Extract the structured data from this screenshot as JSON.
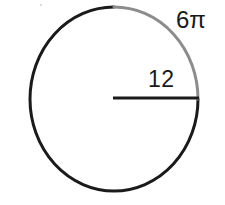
{
  "figure": {
    "type": "circle-geometry-diagram",
    "background_color": "#ffffff",
    "circle": {
      "center_x": 114,
      "center_y": 99,
      "radius_x": 84,
      "radius_y": 92,
      "stroke_color_main": "#1a1a1a",
      "stroke_color_arc": "#8c8c8c",
      "stroke_width": 3
    },
    "arc": {
      "label": "6π",
      "value": 6,
      "unit": "pi",
      "description": "highlighted arc from top of circle clockwise to right of circle",
      "start_angle_deg": 270,
      "end_angle_deg": 0,
      "color": "#8c8c8c"
    },
    "radius": {
      "label": "12",
      "value": 12,
      "description": "horizontal radius segment from center to right edge of circle",
      "color": "#1a1a1a"
    }
  }
}
